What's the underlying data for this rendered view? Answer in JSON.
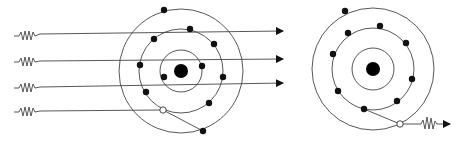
{
  "diagram": {
    "colors": {
      "line": "#444444",
      "electron": "#111111",
      "nucleus": "#000000",
      "background": "#ffffff"
    },
    "left_atom": {
      "nucleus": {
        "cx": 181,
        "cy": 71,
        "r": 7
      },
      "shells": [
        {
          "r": 21
        },
        {
          "r": 42
        },
        {
          "r": 62
        }
      ],
      "electrons": [
        {
          "cx": 164,
          "cy": 77
        },
        {
          "cx": 202,
          "cy": 66
        },
        {
          "cx": 140,
          "cy": 65
        },
        {
          "cx": 154,
          "cy": 39
        },
        {
          "cx": 190,
          "cy": 29
        },
        {
          "cx": 214,
          "cy": 44
        },
        {
          "cx": 223,
          "cy": 77
        },
        {
          "cx": 209,
          "cy": 103
        },
        {
          "cx": 146,
          "cy": 92
        },
        {
          "cx": 164,
          "cy": 10
        },
        {
          "cx": 203,
          "cy": 131
        }
      ],
      "vacancy": {
        "cx": 163,
        "cy": 110
      },
      "ejected_path": {
        "x1": 163,
        "y1": 110,
        "x2": 203,
        "y2": 131
      }
    },
    "incoming_photons": [
      {
        "y": 34,
        "x_start": 14,
        "x_end": 283
      },
      {
        "y": 60,
        "x_start": 14,
        "x_end": 283
      },
      {
        "y": 85,
        "x_start": 14,
        "x_end": 283
      },
      {
        "y": 110,
        "x_start": 14,
        "x_end": 163
      }
    ],
    "right_atom": {
      "nucleus": {
        "cx": 373,
        "cy": 69,
        "r": 7
      },
      "shells": [
        {
          "r": 21
        },
        {
          "r": 41
        },
        {
          "r": 61
        }
      ],
      "electrons": [
        {
          "cx": 345,
          "cy": 11
        },
        {
          "cx": 348,
          "cy": 33
        },
        {
          "cx": 380,
          "cy": 26
        },
        {
          "cx": 406,
          "cy": 43
        },
        {
          "cx": 333,
          "cy": 54
        },
        {
          "cx": 412,
          "cy": 79
        },
        {
          "cx": 338,
          "cy": 91
        },
        {
          "cx": 397,
          "cy": 101
        },
        {
          "cx": 364,
          "cy": 109
        }
      ],
      "vacancy": {
        "cx": 400,
        "cy": 124
      },
      "transition_path": {
        "x1": 364,
        "y1": 109,
        "x2": 400,
        "y2": 124
      }
    },
    "emitted_photon": {
      "y": 124,
      "x_start": 404,
      "x_end": 451
    }
  }
}
